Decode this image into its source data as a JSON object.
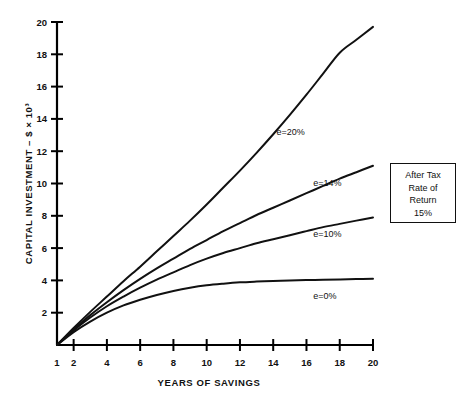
{
  "chart_data": {
    "type": "line",
    "title": "",
    "xlabel": "YEARS OF SAVINGS",
    "ylabel": "CAPITAL INVESTMENT – $ × 10³",
    "xlim": [
      1,
      20
    ],
    "ylim": [
      0,
      20
    ],
    "grid": false,
    "legend_position": "inline-right",
    "xticks": [
      1,
      2,
      4,
      6,
      8,
      10,
      12,
      14,
      16,
      18,
      20
    ],
    "xticklabels": [
      "1",
      "2",
      "4",
      "6",
      "8",
      "10",
      "12",
      "14",
      "16",
      "18",
      "20"
    ],
    "yticks": [
      2,
      4,
      6,
      8,
      10,
      12,
      14,
      16,
      18,
      20
    ],
    "yticklabels": [
      "2",
      "4",
      "6",
      "8",
      "10",
      "12",
      "14",
      "16",
      "18",
      "20"
    ],
    "x": [
      1,
      2,
      3,
      4,
      5,
      6,
      7,
      8,
      9,
      10,
      11,
      12,
      13,
      14,
      15,
      16,
      17,
      18,
      19,
      20
    ],
    "series": [
      {
        "name": "e=20%",
        "label": "e=20%",
        "color": "#111111",
        "label_x": 14.2,
        "label_y": 13.0,
        "values": [
          0.0,
          1.05,
          2.05,
          3.0,
          3.95,
          4.85,
          5.8,
          6.75,
          7.7,
          8.7,
          9.75,
          10.8,
          11.9,
          13.05,
          14.25,
          15.5,
          16.8,
          18.1,
          18.9,
          19.7
        ]
      },
      {
        "name": "e=14%",
        "label": "e=14%",
        "color": "#111111",
        "label_x": 16.4,
        "label_y": 9.85,
        "values": [
          0.0,
          0.95,
          1.85,
          2.65,
          3.4,
          4.1,
          4.75,
          5.35,
          5.95,
          6.5,
          7.05,
          7.55,
          8.05,
          8.5,
          8.95,
          9.4,
          9.85,
          10.3,
          10.7,
          11.1
        ]
      },
      {
        "name": "e=10%",
        "label": "e=10%",
        "color": "#111111",
        "label_x": 16.4,
        "label_y": 6.7,
        "values": [
          0.0,
          0.9,
          1.7,
          2.4,
          3.0,
          3.55,
          4.05,
          4.5,
          4.95,
          5.35,
          5.7,
          6.0,
          6.3,
          6.55,
          6.8,
          7.05,
          7.3,
          7.5,
          7.7,
          7.9
        ]
      },
      {
        "name": "e=0%",
        "label": "e=0%",
        "color": "#111111",
        "label_x": 16.4,
        "label_y": 2.85,
        "values": [
          0.0,
          0.8,
          1.45,
          2.0,
          2.45,
          2.8,
          3.1,
          3.35,
          3.55,
          3.7,
          3.8,
          3.88,
          3.93,
          3.97,
          4.0,
          4.02,
          4.04,
          4.06,
          4.08,
          4.1
        ]
      }
    ],
    "annotation_box": {
      "lines": [
        "After Tax",
        "Rate of",
        "Return",
        "15%"
      ]
    }
  }
}
